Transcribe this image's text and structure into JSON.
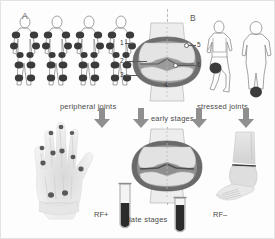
{
  "figure": {
    "panels": [
      {
        "letter": "A",
        "caption": "peripheral joints",
        "figure_count": 4,
        "marked_joints": [
          "shoulder",
          "elbow",
          "wrist",
          "hand",
          "knee",
          "ankle"
        ],
        "symmetry": "bilateral symmetric",
        "xray_region": "hand",
        "serology_label": "RF+",
        "serology_tube_fill": "dark"
      },
      {
        "letter": "B",
        "caption": "stressed joints",
        "figure_count": 2,
        "marked_joints": [
          "knee",
          "ankle"
        ],
        "symmetry": "asymmetric weight-bearing",
        "xray_region": "foot and ankle",
        "serology_label": "RF–",
        "serology_tube_fill": "dark"
      }
    ],
    "stage_labels": {
      "early": "early stages",
      "late": "late stages"
    },
    "knee_numbers": [
      "1",
      "2",
      "3",
      "4",
      "5",
      "6"
    ],
    "colors": {
      "joint_marker": "#3b3b3b",
      "outline": "#8d8d8d",
      "cartilage_dark": "#6e6e6e",
      "cartilage_mid": "#9a9a9a",
      "bone_light": "#dcdcdc",
      "arrow": "#8f8f8f",
      "tube_fill": "#2b2b2b",
      "text": "#4a4a4a",
      "background": "#fdfdfd"
    }
  }
}
